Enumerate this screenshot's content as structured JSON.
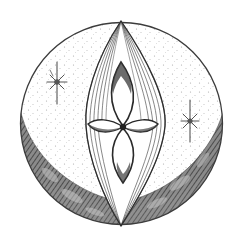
{
  "image": {
    "description": "Engraving-style circular emblem: stippled disc with a dark crescent along the lower rim, a vertical almond (vesica) filled with curved hatch lines, a four-petal flower at its center, and two eight-pointed stars on either side.",
    "colors": {
      "background": "#ffffff",
      "ink": "#2a2a2a",
      "mid_ink": "#6a6a6a",
      "light_ink": "#a8a8a8",
      "stipple": "#9a9a9a"
    },
    "elements": {
      "disc": {
        "cx": 121.5,
        "cy": 123.5,
        "r": 101
      },
      "crescent": {
        "label": "shaded crescent"
      },
      "vesica": {
        "top": [
          121,
          21
        ],
        "bottom": [
          121,
          226
        ],
        "left_x": 86,
        "right_x": 165
      },
      "flower": {
        "center": [
          123,
          127
        ]
      },
      "stars": [
        {
          "cx": 57,
          "cy": 82,
          "label": "left star"
        },
        {
          "cx": 190,
          "cy": 121,
          "label": "right star"
        }
      ]
    }
  }
}
